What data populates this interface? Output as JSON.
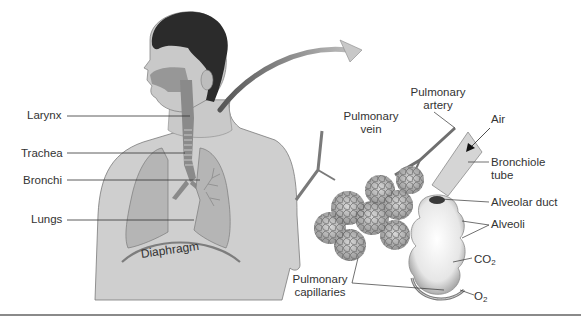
{
  "figure": {
    "left_panel": {
      "subject": "human-torso-respiratory-system",
      "labels": {
        "larynx": "Larynx",
        "trachea": "Trachea",
        "bronchi": "Bronchi",
        "lungs": "Lungs",
        "diaphragm": "Diaphragm"
      }
    },
    "right_panel": {
      "subject": "alveoli-closeup",
      "labels": {
        "pulmonary_vein_l1": "Pulmonary",
        "pulmonary_vein_l2": "vein",
        "pulmonary_artery_l1": "Pulmonary",
        "pulmonary_artery_l2": "artery",
        "air": "Air",
        "bronchiole_l1": "Bronchiole",
        "bronchiole_l2": "tube",
        "alveolar_duct": "Alveolar duct",
        "alveoli": "Alveoli",
        "co2_base": "CO",
        "co2_sub": "2",
        "o2_base": "O",
        "o2_sub": "2",
        "capillaries_l1": "Pulmonary",
        "capillaries_l2": "capillaries"
      }
    },
    "colors": {
      "skin": "#c9c9c9",
      "hair": "#2a2a2a",
      "airway": "#8c8c8c",
      "lung": "#b5b5b5",
      "leader_line": "#333333",
      "rule": "#8a8a8a"
    }
  }
}
